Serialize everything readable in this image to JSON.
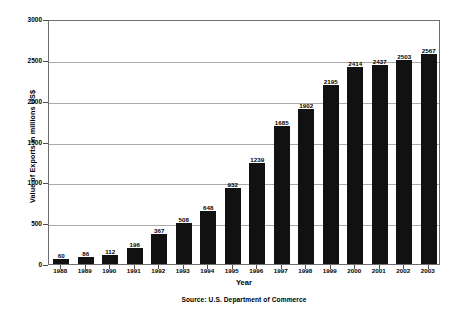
{
  "chart_data": {
    "type": "bar",
    "title": "",
    "xlabel": "Year",
    "ylabel": "Value of Exports in millions US$",
    "categories": [
      "1988",
      "1989",
      "1990",
      "1991",
      "1992",
      "1993",
      "1994",
      "1995",
      "1996",
      "1997",
      "1998",
      "1999",
      "2000",
      "2001",
      "2002",
      "2003"
    ],
    "values": [
      60,
      86,
      112,
      196,
      367,
      508,
      648,
      932,
      1239,
      1685,
      1902,
      2195,
      2414,
      2437,
      2503,
      2567
    ],
    "ylim": [
      0,
      3000
    ],
    "yticks": [
      0,
      500,
      1000,
      1500,
      2000,
      2500,
      3000
    ],
    "ytick_labels": [
      "0",
      "500",
      "1000",
      "1500",
      "2000",
      "2500",
      "3000"
    ],
    "grid": true,
    "legend": "none",
    "bar_color": "#111111",
    "grid_color": "#a9a9a9",
    "axis_color": "#6e6e6e",
    "data_labels": [
      "60",
      "86",
      "112",
      "196",
      "367",
      "508",
      "648",
      "932",
      "1239",
      "1685",
      "1902",
      "2195",
      "2414",
      "2437",
      "2503",
      "2567"
    ]
  },
  "footer": {
    "source": "Source:  U.S. Department of Commerce"
  }
}
